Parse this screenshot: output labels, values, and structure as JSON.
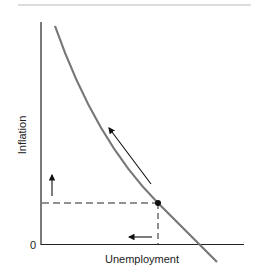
{
  "diagram": {
    "title": "",
    "x_axis_label": "Unemployment",
    "y_axis_label": "Inflation",
    "origin_label": "0",
    "colors": {
      "curve": "#777777",
      "axis": "#222222",
      "rule": "#bbbbbb"
    },
    "elements": [
      {
        "type": "curve",
        "name": "phillips-curve",
        "description": "downward sloping convex curve"
      },
      {
        "type": "point",
        "name": "equilibrium-point"
      },
      {
        "type": "dashed-line",
        "name": "horizontal-guide"
      },
      {
        "type": "dashed-line",
        "name": "vertical-guide"
      },
      {
        "type": "arrow",
        "name": "along-curve-arrow",
        "direction": "up-left"
      },
      {
        "type": "arrow",
        "name": "inflation-up-arrow",
        "direction": "up"
      },
      {
        "type": "arrow",
        "name": "unemployment-down-arrow",
        "direction": "left"
      }
    ]
  }
}
